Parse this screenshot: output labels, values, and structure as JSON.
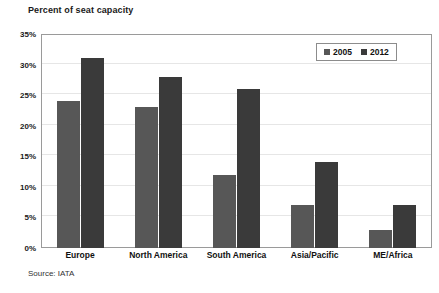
{
  "chart_data": {
    "type": "bar",
    "title": "Percent of seat capacity",
    "xlabel": "",
    "ylabel": "",
    "categories": [
      "Europe",
      "North America",
      "South America",
      "Asia/Pacific",
      "ME/Africa"
    ],
    "series": [
      {
        "name": "2005",
        "color": "#575757",
        "values": [
          24,
          23,
          12,
          7,
          3
        ]
      },
      {
        "name": "2012",
        "color": "#3a3a3a",
        "values": [
          31,
          28,
          26,
          14,
          7
        ]
      }
    ],
    "ylim": [
      0,
      35
    ],
    "ytick_step": 5,
    "ytick_labels": [
      "0%",
      "5%",
      "10%",
      "15%",
      "20%",
      "25%",
      "30%",
      "35%"
    ],
    "value_unit": "%",
    "grid": true,
    "legend_position": "top-right",
    "source": "Source: IATA"
  }
}
